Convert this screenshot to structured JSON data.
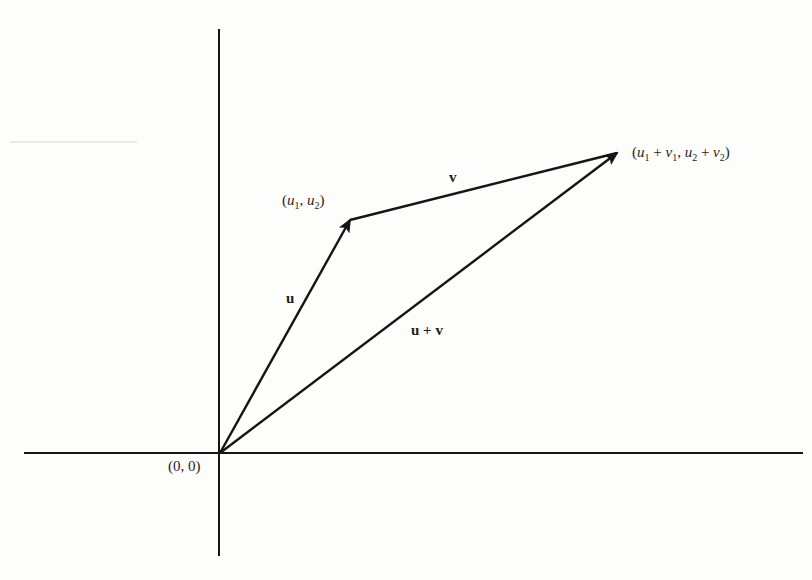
{
  "diagram": {
    "kind": "vector-addition",
    "colors": {
      "background": "#fdfdfc",
      "ink": "#151515",
      "faint_line": "#d6d6d6"
    },
    "axes": {
      "origin": {
        "x": 220,
        "y": 453
      },
      "x_axis": {
        "x1": 24,
        "x2": 803,
        "y": 453
      },
      "y_axis": {
        "x": 219,
        "y1": 29,
        "y2": 556
      }
    },
    "points": {
      "origin": {
        "x": 220,
        "y": 453
      },
      "u_tip": {
        "x": 350,
        "y": 220
      },
      "sum_tip": {
        "x": 617,
        "y": 153
      }
    },
    "vectors": [
      {
        "name": "u",
        "from": "origin",
        "to": "u_tip"
      },
      {
        "name": "v",
        "from": "u_tip",
        "to": "sum_tip"
      },
      {
        "name": "u+v",
        "from": "origin",
        "to": "sum_tip"
      }
    ],
    "labels": {
      "origin": "(0, 0)",
      "u_vector": "u",
      "v_vector": "v",
      "sum_vector": "u + v",
      "u_point": {
        "open": "(",
        "a": "u",
        "a_sub": "1",
        "sep": ", ",
        "b": "u",
        "b_sub": "2",
        "close": ")"
      },
      "sum_point": {
        "open": "(",
        "a": "u",
        "a_sub": "1",
        "plus1": " + ",
        "b": "v",
        "b_sub": "1",
        "sep": ", ",
        "c": "u",
        "c_sub": "2",
        "plus2": " + ",
        "d": "v",
        "d_sub": "2",
        "close": ")"
      }
    }
  }
}
